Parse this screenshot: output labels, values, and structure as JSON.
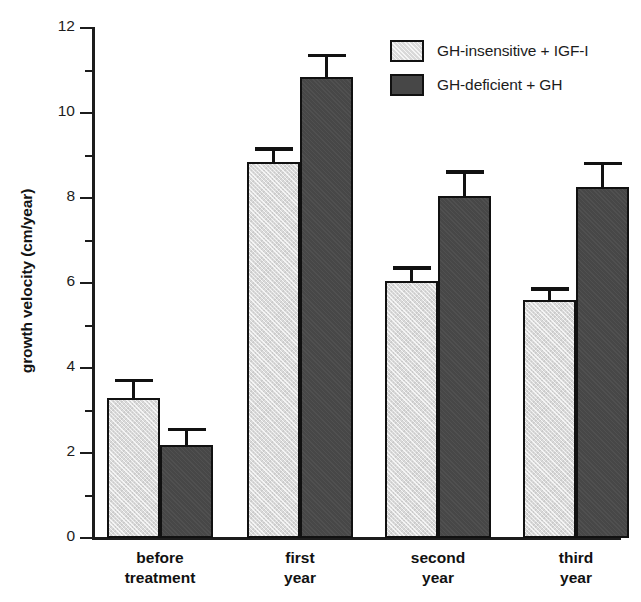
{
  "chart_data": {
    "type": "bar",
    "title": "",
    "xlabel": "",
    "ylabel": "growth velocity (cm/year)",
    "ylim": [
      0,
      12
    ],
    "ytick_labels": [
      "0",
      "2",
      "4",
      "6",
      "8",
      "10",
      "12"
    ],
    "ytick_values": [
      0,
      2,
      4,
      6,
      8,
      10,
      12
    ],
    "minor_ytick_values": [
      1,
      3,
      5,
      7,
      9,
      11
    ],
    "grid": false,
    "legend_position": "top-right",
    "categories": [
      "before treatment",
      "first year",
      "second year",
      "third year"
    ],
    "category_lines": [
      [
        "before",
        "treatment"
      ],
      [
        "first",
        "year"
      ],
      [
        "second",
        "year"
      ],
      [
        "third",
        "year"
      ]
    ],
    "series": [
      {
        "name": "GH-insensitive + IGF-I",
        "color": "#d9d9d9",
        "values": [
          3.3,
          8.85,
          6.05,
          5.6
        ],
        "errors": [
          0.45,
          0.35,
          0.35,
          0.3
        ]
      },
      {
        "name": "GH-deficient + GH",
        "color": "#474747",
        "values": [
          2.2,
          10.85,
          8.05,
          8.25
        ],
        "errors": [
          0.4,
          0.55,
          0.6,
          0.6
        ]
      }
    ]
  },
  "legend": {
    "entries": [
      {
        "label": "GH-insensitive + IGF-I",
        "swatch": "light"
      },
      {
        "label": "GH-deficient + GH",
        "swatch": "dark"
      }
    ]
  },
  "axis": {
    "y_title": "growth velocity (cm/year)"
  },
  "caption_sliver": "",
  "colors": {
    "light_bar": "#d9d9d9",
    "dark_bar": "#474747",
    "axis": "#1c1c1c",
    "text": "#111111"
  }
}
